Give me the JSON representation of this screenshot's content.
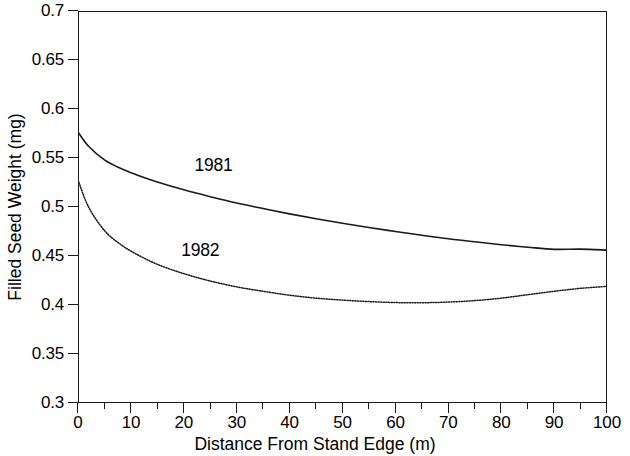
{
  "chart_data": {
    "type": "line",
    "title": "",
    "xlabel": "Distance From Stand Edge (m)",
    "ylabel": "Filled Seed Weight (mg)",
    "xlim": [
      0,
      100
    ],
    "ylim": [
      0.3,
      0.7
    ],
    "xticks": [
      0,
      10,
      20,
      30,
      40,
      50,
      60,
      70,
      80,
      90,
      100
    ],
    "xtick_labels": [
      "0",
      "10",
      "20",
      "30",
      "40",
      "50",
      "60",
      "70",
      "80",
      "90",
      "100"
    ],
    "xticks_minor": [
      5,
      15,
      25,
      35,
      45,
      55,
      65,
      75,
      85,
      95
    ],
    "yticks": [
      0.3,
      0.35,
      0.4,
      0.45,
      0.5,
      0.55,
      0.6,
      0.65,
      0.7
    ],
    "ytick_labels": [
      "0.3",
      "0.35",
      "0.4",
      "0.45",
      "0.5",
      "0.55",
      "0.6",
      "0.65",
      "0.7"
    ],
    "grid": false,
    "legend_position": "inline-annotations",
    "axis_color": "#1a1a1a",
    "series": [
      {
        "name": "1981",
        "style": "solid",
        "color": "#1a1a1a",
        "label_x": 22,
        "label_y": 0.543,
        "x": [
          0,
          2,
          5,
          8,
          11,
          15,
          20,
          25,
          30,
          35,
          40,
          45,
          50,
          55,
          60,
          65,
          70,
          75,
          80,
          85,
          90,
          95,
          100
        ],
        "y": [
          0.5765,
          0.562,
          0.548,
          0.5395,
          0.533,
          0.5255,
          0.5175,
          0.5105,
          0.504,
          0.4985,
          0.493,
          0.488,
          0.4835,
          0.479,
          0.475,
          0.4712,
          0.4676,
          0.4645,
          0.4615,
          0.459,
          0.4568,
          0.457,
          0.456
        ]
      },
      {
        "name": "1982",
        "style": "dotted",
        "color": "#1a1a1a",
        "label_x": 19.5,
        "label_y": 0.456,
        "x": [
          0,
          2,
          5,
          8,
          11,
          15,
          20,
          25,
          30,
          35,
          40,
          45,
          50,
          55,
          60,
          65,
          70,
          75,
          80,
          85,
          90,
          95,
          100
        ],
        "y": [
          0.5276,
          0.5,
          0.476,
          0.462,
          0.452,
          0.4415,
          0.432,
          0.4245,
          0.4185,
          0.414,
          0.41,
          0.407,
          0.405,
          0.4035,
          0.4025,
          0.4023,
          0.403,
          0.4045,
          0.407,
          0.4105,
          0.414,
          0.417,
          0.419
        ]
      }
    ]
  },
  "figure": {
    "background_color": "#ffffff"
  }
}
